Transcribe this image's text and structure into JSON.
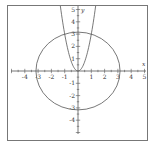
{
  "chart_data": {
    "type": "line",
    "title": "",
    "xlabel": "x",
    "ylabel": "y",
    "xlim": [
      -5,
      5
    ],
    "ylim": [
      -5,
      5
    ],
    "grid": false,
    "x_ticks": [
      -4,
      -3,
      -2,
      -1,
      1,
      2,
      3,
      4,
      5
    ],
    "y_ticks": [
      -4,
      -3,
      -2,
      -1,
      1,
      2,
      3,
      4,
      5
    ],
    "x_tick_labels": [
      "-4",
      "-3",
      "-2",
      "-1",
      "1",
      "2",
      "3",
      "4",
      "5"
    ],
    "y_tick_labels": [
      "-4",
      "-3",
      "-2",
      "-1",
      "1",
      "2",
      "3",
      "4",
      "5"
    ],
    "series": [
      {
        "name": "circle",
        "equation": "x^2 + y^2 = 10",
        "kind": "circle",
        "center": [
          0,
          0
        ],
        "radius_squared": 10
      },
      {
        "name": "parabola",
        "equation": "y = 3x^2",
        "kind": "parabola",
        "coefficient": 3
      }
    ],
    "intersections": [
      [
        -1,
        3
      ],
      [
        1,
        3
      ]
    ],
    "colors": {
      "curve": "#555555",
      "axis": "#555555",
      "frame": "#777777"
    }
  }
}
